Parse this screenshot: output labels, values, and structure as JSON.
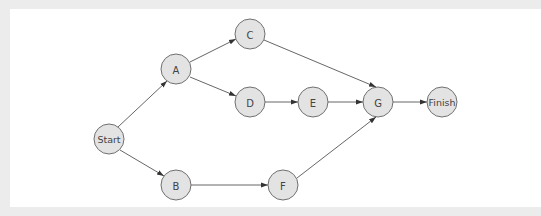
{
  "diagram": {
    "type": "network-diagram",
    "colors": {
      "background": "#ececec",
      "panel": "#ffffff",
      "node_fill": "#e3e3e3",
      "node_stroke": "#707070",
      "edge": "#555555",
      "label": "#444444"
    },
    "nodes": {
      "start": {
        "label": "Start",
        "x": 109,
        "y": 139
      },
      "a": {
        "label": "A",
        "x": 176,
        "y": 69
      },
      "b": {
        "label": "B",
        "x": 176,
        "y": 185
      },
      "c": {
        "label": "C",
        "x": 250,
        "y": 34
      },
      "d": {
        "label": "D",
        "x": 250,
        "y": 102
      },
      "e": {
        "label": "E",
        "x": 313,
        "y": 102
      },
      "f": {
        "label": "F",
        "x": 283,
        "y": 185
      },
      "g": {
        "label": "G",
        "x": 378,
        "y": 102
      },
      "finish": {
        "label": "Finish",
        "x": 442,
        "y": 102
      }
    },
    "edges": [
      {
        "from": "Start",
        "to": "A"
      },
      {
        "from": "Start",
        "to": "B"
      },
      {
        "from": "A",
        "to": "C"
      },
      {
        "from": "A",
        "to": "D"
      },
      {
        "from": "D",
        "to": "E"
      },
      {
        "from": "E",
        "to": "G"
      },
      {
        "from": "C",
        "to": "G"
      },
      {
        "from": "B",
        "to": "F"
      },
      {
        "from": "F",
        "to": "G"
      },
      {
        "from": "G",
        "to": "Finish"
      }
    ]
  }
}
